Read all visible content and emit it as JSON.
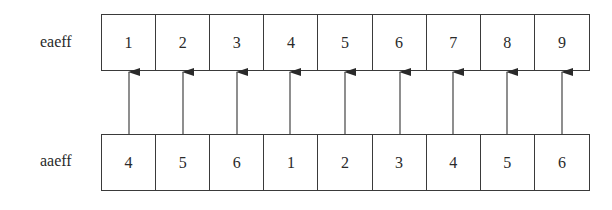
{
  "rows": {
    "top": {
      "label": "eaeff",
      "cells": [
        "1",
        "2",
        "3",
        "4",
        "5",
        "6",
        "7",
        "8",
        "9"
      ]
    },
    "bottom": {
      "label": "aaeff",
      "cells": [
        "4",
        "5",
        "6",
        "1",
        "2",
        "3",
        "4",
        "5",
        "6"
      ]
    }
  },
  "arrows": {
    "direction": "bottom-to-top",
    "count": 9,
    "mapping": [
      [
        0,
        0
      ],
      [
        1,
        1
      ],
      [
        2,
        2
      ],
      [
        3,
        3
      ],
      [
        4,
        4
      ],
      [
        5,
        5
      ],
      [
        6,
        6
      ],
      [
        7,
        7
      ],
      [
        8,
        8
      ]
    ]
  }
}
